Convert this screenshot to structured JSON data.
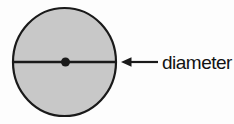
{
  "figure": {
    "label": "diameter",
    "colors": {
      "background": "#fdfdfd",
      "circle_fill": "#c8c8c8",
      "stroke": "#1a1a1a",
      "text": "#121212"
    }
  }
}
